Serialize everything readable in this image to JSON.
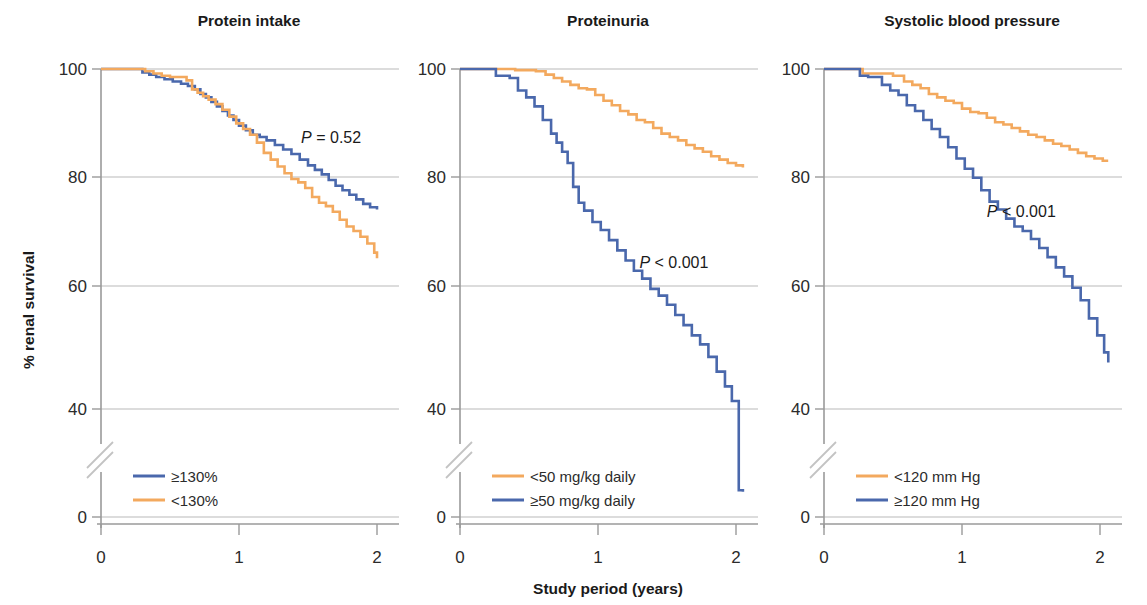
{
  "figure": {
    "width": 1147,
    "height": 605,
    "background": "#ffffff",
    "y_axis_label": "% renal survival",
    "x_axis_label": "Study period (years)",
    "colors": {
      "blue": "#4a68ac",
      "orange": "#f3a95e",
      "grid": "#b9b9b9",
      "axis": "#9a9a9a",
      "text": "#1a1a1a"
    }
  },
  "chart_data": [
    {
      "type": "line",
      "title": "Protein intake",
      "xlabel": "Study period (years)",
      "ylabel": "% renal survival",
      "xlim": [
        0,
        2.1
      ],
      "ylim": [
        0,
        100
      ],
      "yticks": [
        0,
        40,
        60,
        80,
        100
      ],
      "xticks": [
        0,
        1,
        2
      ],
      "grid": true,
      "axis_break_y": [
        5,
        35
      ],
      "annotation": "P = 0.52",
      "annotation_pos": [
        1.45,
        88
      ],
      "legend_position": "lower-left",
      "step": "post",
      "series": [
        {
          "name": "≥130%",
          "color": "#4a68ac",
          "x": [
            0,
            0.22,
            0.3,
            0.35,
            0.4,
            0.46,
            0.52,
            0.58,
            0.63,
            0.68,
            0.72,
            0.76,
            0.8,
            0.84,
            0.88,
            0.92,
            0.96,
            1.0,
            1.05,
            1.1,
            1.15,
            1.2,
            1.26,
            1.32,
            1.38,
            1.44,
            1.5,
            1.55,
            1.6,
            1.65,
            1.7,
            1.75,
            1.8,
            1.85,
            1.9,
            1.95,
            2.0
          ],
          "y": [
            100,
            100,
            99.4,
            99.0,
            98.6,
            98.2,
            97.8,
            97.4,
            97.0,
            96.4,
            95.6,
            95.0,
            94.2,
            93.4,
            92.6,
            91.8,
            91.0,
            90.0,
            89.2,
            88.4,
            88.0,
            87.4,
            86.6,
            85.8,
            85.0,
            84.0,
            83.0,
            82.2,
            81.4,
            80.4,
            79.4,
            78.6,
            77.8,
            77.0,
            76.2,
            75.6,
            75.2
          ]
        },
        {
          "name": "<130%",
          "color": "#f3a95e",
          "x": [
            0,
            0.25,
            0.32,
            0.38,
            0.44,
            0.5,
            0.56,
            0.62,
            0.66,
            0.7,
            0.74,
            0.78,
            0.83,
            0.88,
            0.93,
            0.98,
            1.03,
            1.08,
            1.13,
            1.18,
            1.23,
            1.28,
            1.33,
            1.38,
            1.43,
            1.48,
            1.53,
            1.58,
            1.63,
            1.68,
            1.73,
            1.78,
            1.83,
            1.88,
            1.93,
            1.98,
            2.0
          ],
          "y": [
            100,
            100,
            99.6,
            99.2,
            98.8,
            98.6,
            98.6,
            98.0,
            96.4,
            95.8,
            95.2,
            94.6,
            93.8,
            92.8,
            91.6,
            90.4,
            89.4,
            88.4,
            87.0,
            85.2,
            84.0,
            82.8,
            81.6,
            80.6,
            80.0,
            79.0,
            77.4,
            76.4,
            75.8,
            74.8,
            73.4,
            72.2,
            71.4,
            70.4,
            69.2,
            67.6,
            66.6
          ]
        }
      ]
    },
    {
      "type": "line",
      "title": "Proteinuria",
      "xlabel": "Study period (years)",
      "ylabel": "% renal survival",
      "xlim": [
        0,
        2.1
      ],
      "ylim": [
        0,
        100
      ],
      "yticks": [
        0,
        40,
        60,
        80,
        100
      ],
      "xticks": [
        0,
        1,
        2
      ],
      "grid": true,
      "axis_break_y": [
        5,
        35
      ],
      "annotation": "P < 0.001",
      "annotation_pos": [
        1.3,
        66
      ],
      "legend_position": "lower-left",
      "step": "post",
      "series": [
        {
          "name": "<50 mg/kg daily",
          "color": "#f3a95e",
          "x": [
            0,
            0.22,
            0.4,
            0.55,
            0.62,
            0.68,
            0.74,
            0.8,
            0.86,
            0.92,
            0.98,
            1.04,
            1.1,
            1.16,
            1.22,
            1.28,
            1.34,
            1.4,
            1.46,
            1.52,
            1.58,
            1.64,
            1.7,
            1.76,
            1.82,
            1.88,
            1.94,
            2.0,
            2.05
          ],
          "y": [
            100,
            100,
            99.8,
            99.6,
            99.0,
            98.4,
            97.8,
            97.2,
            96.6,
            96.4,
            95.4,
            94.4,
            93.6,
            92.6,
            92.0,
            91.0,
            90.6,
            89.6,
            88.6,
            88.0,
            87.4,
            86.6,
            86.0,
            85.4,
            84.6,
            84.0,
            83.4,
            83.0,
            82.6
          ]
        },
        {
          "name": "≥50 mg/kg daily",
          "color": "#4a68ac",
          "x": [
            0,
            0.2,
            0.26,
            0.36,
            0.42,
            0.48,
            0.54,
            0.6,
            0.66,
            0.7,
            0.74,
            0.78,
            0.82,
            0.86,
            0.9,
            0.96,
            1.02,
            1.08,
            1.14,
            1.2,
            1.26,
            1.32,
            1.38,
            1.44,
            1.5,
            1.56,
            1.62,
            1.68,
            1.74,
            1.8,
            1.86,
            1.92,
            1.97,
            2.02,
            2.05
          ],
          "y": [
            100,
            100,
            98.8,
            98.4,
            96.2,
            95.0,
            93.4,
            91.0,
            88.6,
            87.0,
            85.4,
            83.4,
            79.2,
            76.4,
            75.0,
            73.0,
            71.6,
            69.8,
            68.0,
            66.2,
            64.4,
            63.0,
            61.2,
            60.0,
            58.4,
            56.6,
            54.8,
            53.0,
            51.4,
            49.2,
            46.6,
            44.0,
            41.4,
            39.6,
            37.5
          ]
        }
      ]
    },
    {
      "type": "line",
      "title": "Systolic blood pressure",
      "xlabel": "Study period (years)",
      "ylabel": "% renal survival",
      "xlim": [
        0,
        2.1
      ],
      "ylim": [
        0,
        100
      ],
      "yticks": [
        0,
        40,
        60,
        80,
        100
      ],
      "xticks": [
        0,
        1,
        2
      ],
      "grid": true,
      "axis_break_y": [
        5,
        35
      ],
      "annotation": "P < 0.001",
      "annotation_pos": [
        1.18,
        75
      ],
      "legend_position": "lower-left",
      "step": "post",
      "series": [
        {
          "name": "<120 mm Hg",
          "color": "#f3a95e",
          "x": [
            0,
            0.22,
            0.28,
            0.42,
            0.5,
            0.58,
            0.64,
            0.7,
            0.76,
            0.82,
            0.88,
            0.94,
            1.0,
            1.06,
            1.12,
            1.18,
            1.24,
            1.3,
            1.36,
            1.42,
            1.48,
            1.54,
            1.6,
            1.66,
            1.72,
            1.78,
            1.84,
            1.9,
            1.96,
            2.02,
            2.05
          ],
          "y": [
            100,
            100,
            99.2,
            99.2,
            98.8,
            97.8,
            97.2,
            96.6,
            95.6,
            95.0,
            94.4,
            94.0,
            93.0,
            92.4,
            92.2,
            91.4,
            90.6,
            90.2,
            89.6,
            89.0,
            88.4,
            88.0,
            87.4,
            86.8,
            86.4,
            85.8,
            85.2,
            84.6,
            84.2,
            83.8,
            83.6
          ]
        },
        {
          "name": "≥120 mm Hg",
          "color": "#4a68ac",
          "x": [
            0,
            0.2,
            0.26,
            0.32,
            0.42,
            0.48,
            0.54,
            0.6,
            0.66,
            0.72,
            0.78,
            0.84,
            0.9,
            0.96,
            1.02,
            1.08,
            1.14,
            1.2,
            1.26,
            1.32,
            1.38,
            1.44,
            1.5,
            1.56,
            1.62,
            1.68,
            1.74,
            1.8,
            1.86,
            1.92,
            1.98,
            2.03,
            2.06
          ],
          "y": [
            100,
            100,
            98.8,
            98.6,
            97.2,
            96.2,
            95.4,
            93.6,
            92.6,
            91.0,
            89.4,
            88.0,
            86.2,
            84.2,
            82.4,
            80.8,
            78.6,
            76.6,
            75.2,
            73.6,
            72.2,
            71.4,
            70.0,
            68.4,
            66.8,
            65.0,
            63.4,
            61.4,
            59.2,
            56.0,
            53.0,
            50.0,
            48.2
          ]
        }
      ]
    }
  ]
}
